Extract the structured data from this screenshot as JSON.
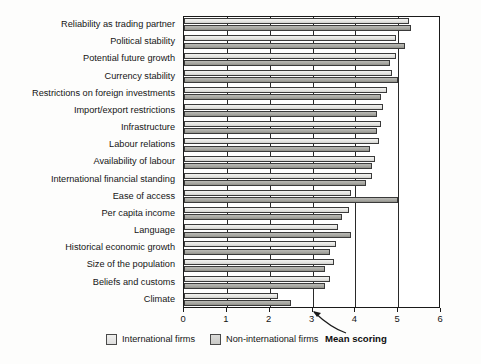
{
  "chart_data": {
    "type": "bar",
    "orientation": "horizontal",
    "title": "",
    "xlabel": "Mean scoring",
    "ylabel": "",
    "xlim": [
      0,
      6
    ],
    "xticks": [
      0,
      1,
      2,
      3,
      4,
      5,
      6
    ],
    "xtick_labels": [
      "0",
      "1",
      "2",
      "3",
      "4",
      "5",
      "6"
    ],
    "grid": true,
    "grid_axis": "x",
    "legend_position": "bottom",
    "categories": [
      "Reliability as trading partner",
      "Political stability",
      "Potential future growth",
      "Currency stability",
      "Restrictions on foreign investments",
      "Import/export restrictions",
      "Infrastructure",
      "Labour relations",
      "Availability of labour",
      "International financial standing",
      "Ease of access",
      "Per capita income",
      "Language",
      "Historical economic growth",
      "Size of the population",
      "Beliefs and customs",
      "Climate"
    ],
    "series": [
      {
        "name": "International firms",
        "color": "#e6e6e3",
        "values": [
          5.25,
          4.95,
          4.95,
          4.85,
          4.75,
          4.65,
          4.6,
          4.55,
          4.45,
          4.4,
          3.9,
          3.85,
          3.6,
          3.55,
          3.5,
          3.4,
          2.2
        ]
      },
      {
        "name": "Non-international firms",
        "color": "#a9a9a4",
        "values": [
          5.3,
          5.15,
          4.8,
          5.0,
          4.6,
          4.5,
          4.5,
          4.35,
          4.4,
          4.25,
          5.0,
          3.7,
          3.9,
          3.4,
          3.3,
          3.3,
          2.5
        ]
      }
    ],
    "annotations": [
      {
        "text": "Mean scoring",
        "points_to_axis_value": 3
      }
    ]
  },
  "legend": {
    "items": [
      {
        "label": "International firms",
        "swatch": "international-firms-swatch"
      },
      {
        "label": "Non-international firms",
        "swatch": "non-international-firms-swatch"
      }
    ],
    "axis_note": "Mean scoring"
  }
}
